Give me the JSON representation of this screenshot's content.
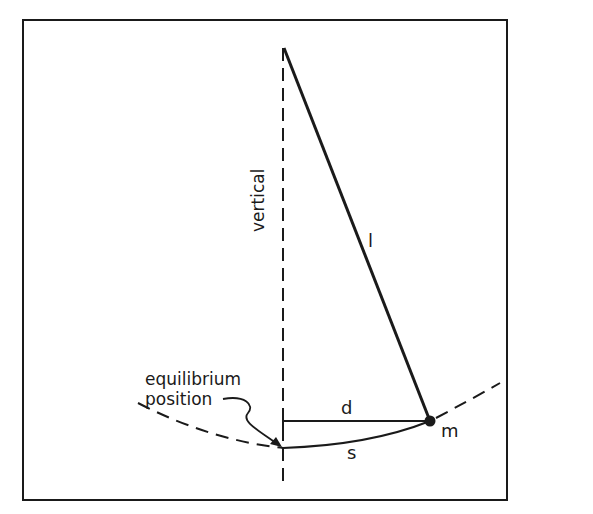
{
  "diagram": {
    "type": "simple pendulum geometry",
    "labels": {
      "vertical": "vertical",
      "length": "l",
      "horizontal_displacement": "d",
      "arc_length": "s",
      "mass": "m",
      "equilibrium_line1": "equilibrium",
      "equilibrium_line2": "position"
    },
    "colors": {
      "ink": "#1a1a1a",
      "background": "#ffffff"
    }
  }
}
